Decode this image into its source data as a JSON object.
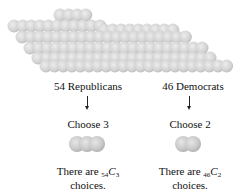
{
  "figure": {
    "population": {
      "description": "cluster of 100 gray spheres representing senators",
      "sphere_color": "#cfcfcf",
      "sphere_highlight": "#e8e8e8",
      "sphere_shadow": "#b5b5b5"
    },
    "left": {
      "group_label": "54 Republicans",
      "choose_label": "Choose 3",
      "sphere_count": 3,
      "result_prefix": "There are ",
      "comb_n": "54",
      "comb_C": "C",
      "comb_k": "3",
      "result_line2": "choices."
    },
    "right": {
      "group_label": "46 Democrats",
      "choose_label": "Choose 2",
      "sphere_count": 2,
      "result_prefix": "There are ",
      "comb_n": "46",
      "comb_C": "C",
      "comb_k": "2",
      "result_line2": "choices."
    }
  }
}
